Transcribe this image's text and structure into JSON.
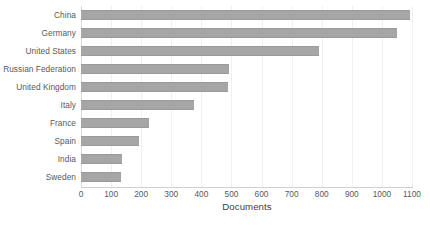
{
  "chart_data": {
    "type": "bar",
    "orientation": "horizontal",
    "title": "",
    "xlabel": "Documents",
    "ylabel": "",
    "xlim": [
      0,
      1100
    ],
    "xticks": [
      0,
      100,
      200,
      300,
      400,
      500,
      600,
      700,
      800,
      900,
      1000,
      1100
    ],
    "xtick_labels": [
      "0",
      "100",
      "200",
      "300",
      "400",
      "500",
      "600",
      "700",
      "800",
      "900",
      "1000",
      "1100"
    ],
    "grid": "vertical",
    "legend": "none",
    "bar_color": "#a6a6a6",
    "categories": [
      "China",
      "Germany",
      "United States",
      "Russian Federation",
      "United Kingdom",
      "Italy",
      "France",
      "Spain",
      "India",
      "Sweden"
    ],
    "values": [
      1095,
      1050,
      790,
      492,
      490,
      375,
      225,
      192,
      136,
      133
    ]
  }
}
